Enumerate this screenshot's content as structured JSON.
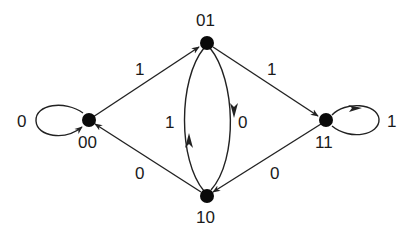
{
  "diagram": {
    "type": "state-transition-graph",
    "nodes": [
      {
        "id": "00",
        "label": "00",
        "x": 89,
        "y": 120
      },
      {
        "id": "01",
        "label": "01",
        "x": 207,
        "y": 43
      },
      {
        "id": "10",
        "label": "10",
        "x": 207,
        "y": 196
      },
      {
        "id": "11",
        "label": "11",
        "x": 326,
        "y": 120
      }
    ],
    "edges": [
      {
        "from": "00",
        "to": "00",
        "label": "0",
        "kind": "self-loop"
      },
      {
        "from": "00",
        "to": "01",
        "label": "1"
      },
      {
        "from": "01",
        "to": "11",
        "label": "1"
      },
      {
        "from": "01",
        "to": "10",
        "label": "0",
        "kind": "arc-right"
      },
      {
        "from": "10",
        "to": "01",
        "label": "1",
        "kind": "arc-left"
      },
      {
        "from": "10",
        "to": "00",
        "label": "0"
      },
      {
        "from": "11",
        "to": "10",
        "label": "0"
      },
      {
        "from": "11",
        "to": "11",
        "label": "1",
        "kind": "self-loop"
      }
    ],
    "colors": {
      "node": "#0a0a0a",
      "edge": "#222222",
      "background": "#ffffff"
    }
  }
}
